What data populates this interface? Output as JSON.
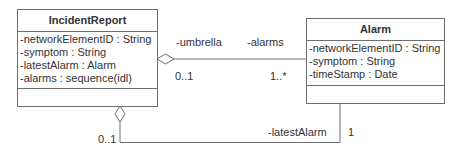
{
  "diagram": {
    "type": "UML class diagram",
    "classes": [
      {
        "name": "IncidentReport",
        "attributes": [
          "-networkElementID : String",
          "-symptom : String",
          "-latestAlarm : Alarm",
          "-alarms : sequence(idl)"
        ],
        "operations": []
      },
      {
        "name": "Alarm",
        "attributes": [
          "-networkElementID : String",
          "-symptom : String",
          "-timeStamp : Date"
        ],
        "operations": []
      }
    ],
    "associations": [
      {
        "kind": "aggregation",
        "from": "IncidentReport",
        "to": "Alarm",
        "from_role": "-umbrella",
        "to_role": "-alarms",
        "from_multiplicity": "0..1",
        "to_multiplicity": "1..*"
      },
      {
        "kind": "aggregation",
        "from": "IncidentReport",
        "to": "Alarm",
        "from_multiplicity": "0..1",
        "to_role": "-latestAlarm",
        "to_multiplicity": "1"
      }
    ]
  }
}
